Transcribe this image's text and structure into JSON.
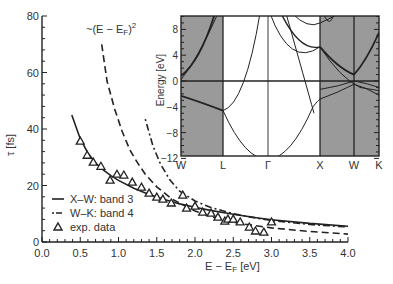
{
  "chart_data": {
    "type": "line",
    "xlabel": "E − E",
    "xlabel_sub": "F",
    "xlabel_unit": " [eV]",
    "ylabel": "τ [fs]",
    "xlim": [
      0.0,
      4.0
    ],
    "ylim": [
      0,
      80
    ],
    "x_ticks": [
      "0.0",
      "0.5",
      "1.0",
      "1.5",
      "2.0",
      "2.5",
      "3.0",
      "3.5",
      "4.0"
    ],
    "y_ticks": [
      "0",
      "20",
      "40",
      "60",
      "80"
    ],
    "grid": false,
    "legend_position": "bottom-left",
    "annotation": {
      "prefix": "~(E − E",
      "sub": "F",
      "suffix": ")",
      "sup": "2"
    },
    "series": [
      {
        "name": "X–W: band 3",
        "style": "solid",
        "x": [
          0.39,
          0.5,
          0.6,
          0.7,
          0.8,
          0.9,
          1.0,
          1.2,
          1.4,
          1.6,
          1.8,
          2.0,
          2.2,
          2.5,
          2.8,
          3.0,
          3.5,
          4.0
        ],
        "y": [
          45,
          36.5,
          31.5,
          28,
          25.5,
          23.5,
          21.8,
          19,
          16.8,
          15,
          13.5,
          12.3,
          11.2,
          9.8,
          8.6,
          7.9,
          6.6,
          5.6
        ]
      },
      {
        "name": "W–K: band 4",
        "style": "dash-dot",
        "x": [
          1.35,
          1.45,
          1.55,
          1.67,
          1.8,
          2.0,
          2.2,
          2.5,
          2.8,
          3.0,
          3.5,
          4.0
        ],
        "y": [
          43.5,
          34,
          27.5,
          22,
          18,
          14.5,
          12.3,
          10,
          8.5,
          7.6,
          6.2,
          5.3
        ]
      },
      {
        "name": "~(E − E_F)^2",
        "style": "dashed",
        "x": [
          0.78,
          0.85,
          0.95,
          1.05,
          1.15,
          1.25,
          1.35,
          1.5,
          1.7,
          2.0,
          2.3,
          2.6,
          3.0,
          3.5,
          4.0
        ],
        "y": [
          70,
          57,
          47,
          39,
          32.5,
          28,
          24,
          19.5,
          15.2,
          11,
          8.3,
          6.5,
          5,
          3.7,
          2.8
        ]
      },
      {
        "name": "exp. data",
        "style": "triangle-markers",
        "x": [
          0.5,
          0.59,
          0.67,
          0.77,
          0.89,
          0.98,
          1.07,
          1.18,
          1.3,
          1.4,
          1.5,
          1.58,
          1.69,
          1.84,
          1.89,
          2.0,
          2.1,
          2.21,
          2.3,
          2.39,
          2.43,
          2.5,
          2.59,
          2.71,
          2.79,
          2.9,
          3.0
        ],
        "y": [
          35.7,
          30.7,
          28.3,
          26.8,
          21.9,
          24,
          23.7,
          21.2,
          19.4,
          17.3,
          15.9,
          15.2,
          13.8,
          16.6,
          12,
          12.7,
          10.6,
          10.2,
          8.8,
          7.4,
          8.1,
          8.1,
          7.1,
          5.3,
          3.9,
          3.5,
          7.1
        ]
      }
    ],
    "inset": {
      "type": "band-structure",
      "ylabel": "Energy [eV]",
      "ylim": [
        -12,
        10
      ],
      "y_ticks": [
        "8",
        "4",
        "0",
        "−4",
        "−8",
        "−12"
      ],
      "k_labels": [
        "W",
        "L",
        "Γ",
        "X",
        "W",
        "K"
      ],
      "shaded_segments": [
        "W–L",
        "X–W–K"
      ],
      "fermi_level": 0
    }
  }
}
